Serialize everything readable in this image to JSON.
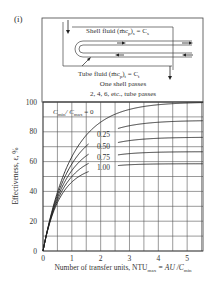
{
  "figure": {
    "panel_label": "(i)",
    "diagram": {
      "shell_label": "Shell fluid (ṁc",
      "shell_sub": "p",
      "shell_tail": ")",
      "shell_sub2": "s",
      "shell_eq": " = C",
      "shell_eq_sub": "s",
      "tube_label": "Tube fluid (ṁc",
      "tube_sub": "p",
      "tube_tail": ")",
      "tube_sub2": "t",
      "tube_eq": " = C",
      "tube_eq_sub": "t",
      "line1": "One shell passes",
      "line2": "2, 4, 6, etc., tube passes"
    }
  },
  "chart_data": {
    "type": "line",
    "xlabel": "Number of transfer units, NTU_max = AU / C_min",
    "xlabel_parts": {
      "main": "Number of transfer units, NTU",
      "sub": "max",
      "mid": " = AU /C",
      "sub2": "min"
    },
    "ylabel": "Effectiveness, ε, %",
    "xlim": [
      0,
      5.55
    ],
    "ylim": [
      0,
      100
    ],
    "xticks": [
      "0",
      "1",
      "2",
      "3",
      "4",
      "5"
    ],
    "yticks": [
      "0",
      "20",
      "40",
      "60",
      "80",
      "100"
    ],
    "grid": true,
    "grid_x_step": 0.5,
    "grid_y_step": 10,
    "legend_title": "C_min / C_max = 0",
    "legend_parts": {
      "c1": "C",
      "s1": "min",
      "slash": "/ C",
      "s2": "max",
      "eq": " = 0"
    },
    "series": [
      {
        "name": "0",
        "label": "",
        "Cr": 0.0,
        "x": [
          0,
          0.5,
          1,
          1.5,
          2,
          3,
          4,
          5
        ],
        "values": [
          0,
          39,
          63,
          78,
          86,
          95,
          98,
          99
        ]
      },
      {
        "name": "0.25",
        "label": "0.25",
        "Cr": 0.25,
        "x": [
          0,
          0.5,
          1,
          1.5,
          2,
          3,
          4,
          5
        ],
        "values": [
          0,
          37,
          58,
          70,
          78,
          85,
          88,
          89
        ]
      },
      {
        "name": "0.50",
        "label": "0.50",
        "Cr": 0.5,
        "x": [
          0,
          0.5,
          1,
          1.5,
          2,
          3,
          4,
          5
        ],
        "values": [
          0,
          36,
          54,
          63,
          69,
          74,
          76,
          77
        ]
      },
      {
        "name": "0.75",
        "label": "0.75",
        "Cr": 0.75,
        "x": [
          0,
          0.5,
          1,
          1.5,
          2,
          3,
          4,
          5
        ],
        "values": [
          0,
          35,
          50,
          57,
          61,
          65,
          67,
          67
        ]
      },
      {
        "name": "1.00",
        "label": "1.00",
        "Cr": 1.0,
        "x": [
          0,
          0.5,
          1,
          1.5,
          2,
          3,
          4,
          5
        ],
        "values": [
          0,
          34,
          46,
          52,
          55,
          58,
          59,
          60
        ]
      }
    ]
  }
}
